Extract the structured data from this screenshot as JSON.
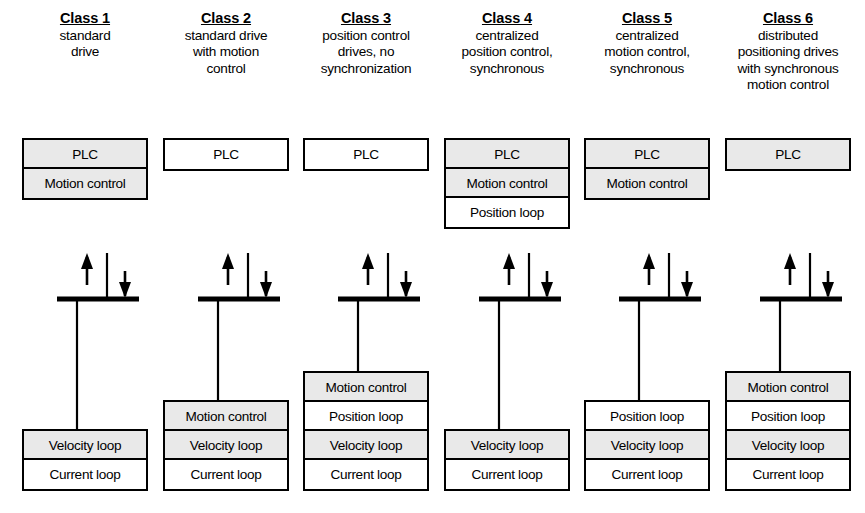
{
  "diagram": {
    "colors": {
      "shaded_cell": "#e9e9e9",
      "plain_cell": "#ffffff",
      "stroke": "#000000",
      "background": "#ffffff"
    },
    "bus_symbol": {
      "name": "fieldbus-connection-symbol",
      "up_arrow": "↑",
      "down_arrow": "↓"
    },
    "columns": [
      {
        "id": "class-1",
        "title": "Class 1",
        "description_lines": [
          "standard",
          "drive"
        ],
        "top_boxes": [
          {
            "label": "PLC",
            "shaded": true
          },
          {
            "label": "Motion control",
            "shaded": true
          }
        ],
        "bottom_boxes": [
          {
            "label": "Velocity loop",
            "shaded": true
          },
          {
            "label": "Current loop",
            "shaded": false
          }
        ]
      },
      {
        "id": "class-2",
        "title": "Class 2",
        "description_lines": [
          "standard drive",
          "with motion",
          "control"
        ],
        "top_boxes": [
          {
            "label": "PLC",
            "shaded": false
          }
        ],
        "bottom_boxes": [
          {
            "label": "Motion control",
            "shaded": true
          },
          {
            "label": "Velocity loop",
            "shaded": true
          },
          {
            "label": "Current loop",
            "shaded": false
          }
        ]
      },
      {
        "id": "class-3",
        "title": "Class 3",
        "description_lines": [
          "position control",
          "drives, no",
          "synchronization"
        ],
        "top_boxes": [
          {
            "label": "PLC",
            "shaded": false
          }
        ],
        "bottom_boxes": [
          {
            "label": "Motion control",
            "shaded": true
          },
          {
            "label": "Position loop",
            "shaded": false
          },
          {
            "label": "Velocity loop",
            "shaded": true
          },
          {
            "label": "Current loop",
            "shaded": false
          }
        ]
      },
      {
        "id": "class-4",
        "title": "Class 4",
        "description_lines": [
          "centralized",
          "position control,",
          "synchronous"
        ],
        "top_boxes": [
          {
            "label": "PLC",
            "shaded": true
          },
          {
            "label": "Motion control",
            "shaded": true
          },
          {
            "label": "Position loop",
            "shaded": false
          }
        ],
        "bottom_boxes": [
          {
            "label": "Velocity loop",
            "shaded": true
          },
          {
            "label": "Current loop",
            "shaded": false
          }
        ]
      },
      {
        "id": "class-5",
        "title": "Class 5",
        "description_lines": [
          "centralized",
          "motion control,",
          "synchronous"
        ],
        "top_boxes": [
          {
            "label": "PLC",
            "shaded": true
          },
          {
            "label": "Motion control",
            "shaded": true
          }
        ],
        "bottom_boxes": [
          {
            "label": "Position loop",
            "shaded": false
          },
          {
            "label": "Velocity loop",
            "shaded": true
          },
          {
            "label": "Current loop",
            "shaded": false
          }
        ]
      },
      {
        "id": "class-6",
        "title": "Class 6",
        "description_lines": [
          "distributed",
          "positioning drives",
          "with synchronous",
          "motion control"
        ],
        "top_boxes": [
          {
            "label": "PLC",
            "shaded": true
          }
        ],
        "bottom_boxes": [
          {
            "label": "Motion control",
            "shaded": true
          },
          {
            "label": "Position loop",
            "shaded": false
          },
          {
            "label": "Velocity loop",
            "shaded": true
          },
          {
            "label": "Current loop",
            "shaded": false
          }
        ]
      }
    ]
  }
}
